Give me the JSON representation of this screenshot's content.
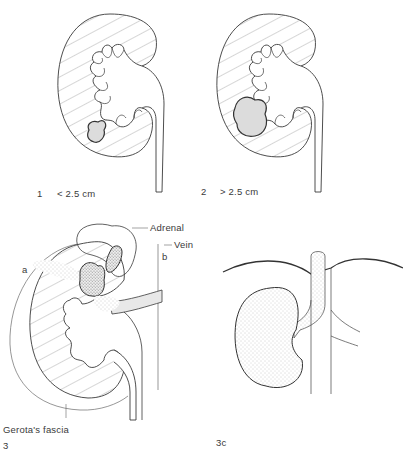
{
  "panels": [
    {
      "id": "1",
      "number": "1",
      "caption": "< 2.5 cm"
    },
    {
      "id": "2",
      "number": "2",
      "caption": "> 2.5 cm"
    },
    {
      "id": "3",
      "number": "3",
      "labels": {
        "adrenal": "Adrenal",
        "vein": "Vein",
        "a": "a",
        "b": "b",
        "fascia": "Gerota's fascia"
      }
    },
    {
      "id": "3c",
      "number": "3c"
    }
  ],
  "colors": {
    "line": "#3a3a3a",
    "hatch": "#8a8a8a",
    "tumor": "#d8d8d8",
    "stipple": "#9a9a9a"
  }
}
